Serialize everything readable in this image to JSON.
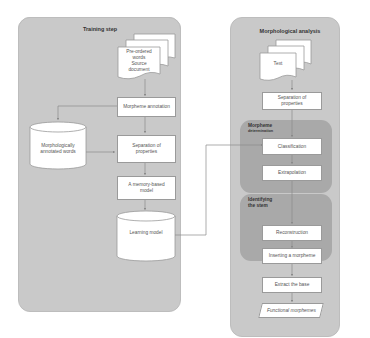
{
  "training": {
    "title": "Training step",
    "source_docs": "Pre-ordered words Source document",
    "source_docs_line1": "Pre-ordered",
    "source_docs_line2": "words",
    "source_docs_line3": "Source",
    "source_docs_line4": "document",
    "morpheme_annotation": "Morpheme annotation",
    "annotated_words": "Morphologically annotated words",
    "annotated_words_line1": "Morphologically",
    "annotated_words_line2": "annotated words",
    "separation": "Separation of properties",
    "separation_line1": "Separation of",
    "separation_line2": "properties",
    "memory_model": "A memory-based model",
    "memory_model_line1": "A memory-based",
    "memory_model_line2": "model",
    "learning_model": "Learning model"
  },
  "analysis": {
    "title": "Morphological analysis",
    "text_doc": "Text",
    "separation_line1": "Separation of",
    "separation_line2": "properties",
    "morpheme_group": {
      "title_line1": "Morpheme",
      "title_line2": "determination",
      "classification": "Classification",
      "extrapolation": "Extrapolation"
    },
    "stem_group": {
      "title_line1": "Identifying",
      "title_line2": "the stem",
      "reconstruction": "Reconstruction",
      "inserting": "Inserting a morpheme"
    },
    "extract_base": "Extract the base",
    "functional_morphemes": "Functional morphemes"
  },
  "colors": {
    "panel": "#c9c9c9",
    "subpanel": "#a9a9a9",
    "box": "#ffffff",
    "line": "#8a8a8a"
  }
}
